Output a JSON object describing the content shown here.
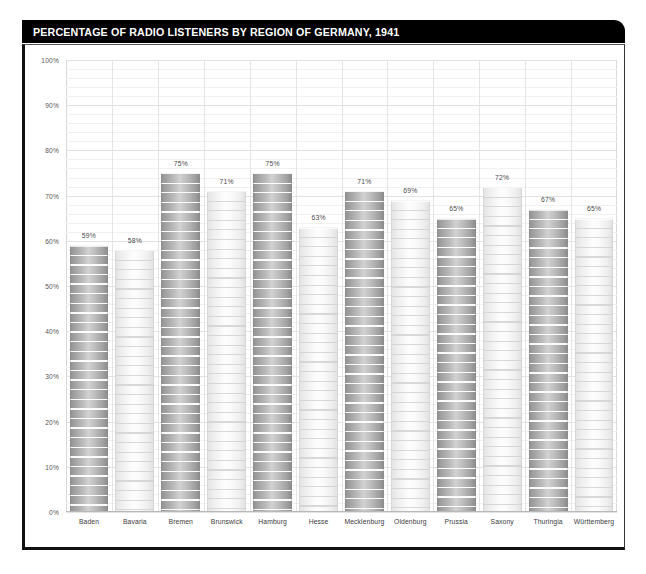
{
  "header": {
    "title": "PERCENTAGE OF RADIO LISTENERS BY REGION OF GERMANY, 1941"
  },
  "chart_data": {
    "type": "bar",
    "title": "PERCENTAGE OF RADIO LISTENERS BY REGION OF GERMANY, 1941",
    "xlabel": "",
    "ylabel": "",
    "ylim": [
      0,
      100
    ],
    "yticks": [
      "0%",
      "10%",
      "20%",
      "30%",
      "40%",
      "50%",
      "60%",
      "70%",
      "80%",
      "90%",
      "100%"
    ],
    "ytick_values": [
      0,
      10,
      20,
      30,
      40,
      50,
      60,
      70,
      80,
      90,
      100
    ],
    "grid": true,
    "legend": "none",
    "categories": [
      "Baden",
      "Bavaria",
      "Bremen",
      "Brunswick",
      "Hamburg",
      "Hesse",
      "Mecklenburg",
      "Oldenburg",
      "Prussia",
      "Saxony",
      "Thuringia",
      "Württemberg"
    ],
    "values": [
      59,
      58,
      75,
      71,
      75,
      63,
      71,
      69,
      65,
      72,
      67,
      65
    ],
    "data_labels": [
      "59%",
      "58%",
      "75%",
      "71%",
      "75%",
      "63%",
      "71%",
      "69%",
      "65%",
      "72%",
      "67%",
      "65%"
    ],
    "bar_styles": [
      "dark",
      "light",
      "dark",
      "light",
      "dark",
      "light",
      "dark",
      "light",
      "dark",
      "light",
      "dark",
      "light"
    ],
    "colors": {
      "title_band": "#000000",
      "title_text": "#ffffff",
      "frame": "#111111",
      "plot_background": "#ffffff",
      "gridline": "#f0f0f0",
      "gridline_major": "#e2e2e2",
      "bar_dark": "#b0b0b0",
      "bar_light": "#f4f4f4",
      "label_text": "#4a4a4a"
    }
  }
}
